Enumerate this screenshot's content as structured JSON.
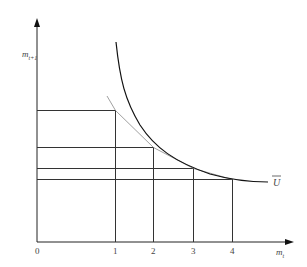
{
  "diagram": {
    "type": "indifference-curve",
    "y_axis_label": "m",
    "y_axis_subscript": "t+1",
    "x_axis_label": "m",
    "x_axis_subscript": "t",
    "origin_label": "0",
    "x_ticks": [
      "1",
      "2",
      "3",
      "4"
    ],
    "curve_label": "U",
    "colors": {
      "line": "#222222",
      "text": "#444444",
      "grid": "#333333"
    }
  }
}
